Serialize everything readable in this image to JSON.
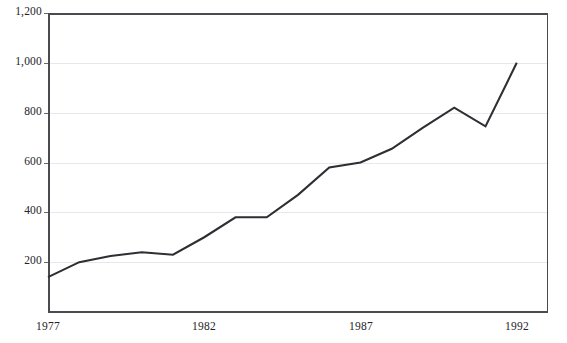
{
  "page": {
    "title_sliver": "",
    "background_color": "#ffffff"
  },
  "chart_data": {
    "type": "line",
    "title": "",
    "subtitle": "",
    "xlabel": "",
    "ylabel": "",
    "x": [
      1977,
      1978,
      1979,
      1980,
      1981,
      1982,
      1983,
      1984,
      1985,
      1986,
      1987,
      1988,
      1989,
      1990,
      1991,
      1992
    ],
    "values": [
      140,
      200,
      225,
      240,
      230,
      300,
      380,
      380,
      470,
      580,
      600,
      655,
      740,
      820,
      745,
      1000
    ],
    "series": [
      {
        "name": "series-1",
        "values": [
          140,
          200,
          225,
          240,
          230,
          300,
          380,
          380,
          470,
          580,
          600,
          655,
          740,
          820,
          745,
          1000
        ]
      }
    ],
    "xlim": [
      1977,
      1993
    ],
    "ylim": [
      0,
      1200
    ],
    "xtick_values": [
      1977,
      1982,
      1987,
      1992
    ],
    "xtick_labels": [
      "1977",
      "1982",
      "1987",
      "1992"
    ],
    "ytick_values": [
      200,
      400,
      600,
      800,
      1000,
      1200
    ],
    "ytick_labels": [
      "200",
      "400",
      "600",
      "800",
      "1,000",
      "1,200"
    ],
    "grid": "horizontal",
    "grid_color": "#e8e8ea",
    "line_color": "#2e2e33",
    "axis_color": "#4a4a4f",
    "legend": "none",
    "markers": "none",
    "annotations": []
  }
}
